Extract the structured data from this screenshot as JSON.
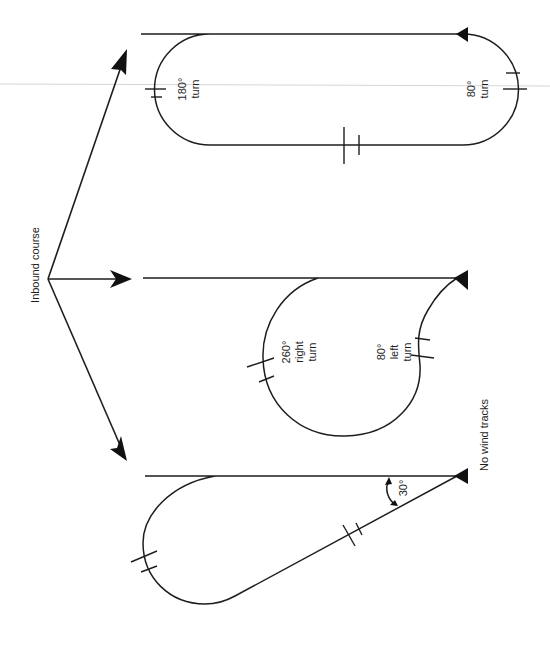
{
  "figure": {
    "origin_label": "Inbound course",
    "bottom_label": "No wind tracks",
    "colors": {
      "ink": "#1e1e1e",
      "background": "#ffffff",
      "scan_line": "#d6d6d6"
    }
  },
  "patterns": [
    {
      "name": "racetrack",
      "turns": [
        {
          "angle": "180°",
          "word": "turn"
        },
        {
          "angle": "180°",
          "word": "turn"
        }
      ]
    },
    {
      "name": "teardrop-circle",
      "turns": [
        {
          "angle": "260°",
          "direction": "right",
          "word": "turn"
        },
        {
          "angle": "80°",
          "direction": "left",
          "word": "turn"
        }
      ]
    },
    {
      "name": "teardrop",
      "angle_label": "30°"
    }
  ]
}
